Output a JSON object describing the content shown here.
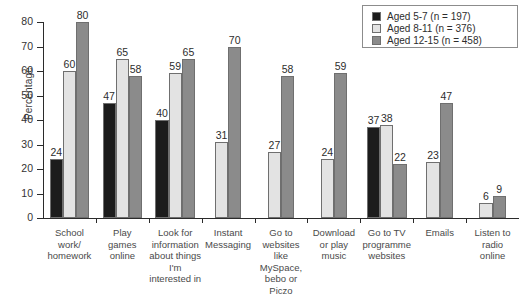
{
  "chart_data": {
    "type": "bar",
    "title": "",
    "xlabel": "",
    "ylabel": "Percentage",
    "ylim": [
      0,
      80
    ],
    "yticks": [
      0,
      10,
      20,
      30,
      40,
      50,
      60,
      70,
      80
    ],
    "grid": false,
    "legend_position": "top-right",
    "categories": [
      "School work/ homework",
      "Play games online",
      "Look for information about things I'm interested in",
      "Instant Messaging",
      "Go to websites like MySpace, bebo or Piczo",
      "Download or play music",
      "Go to TV programme websites",
      "Emails",
      "Listen to radio online"
    ],
    "category_lines": [
      [
        "School",
        "work/",
        "homework"
      ],
      [
        "Play",
        "games",
        "online"
      ],
      [
        "Look for",
        "information",
        "about things",
        "I'm",
        "interested in"
      ],
      [
        "Instant",
        "Messaging"
      ],
      [
        "Go to",
        "websites",
        "like",
        "MySpace,",
        "bebo or",
        "Piczo"
      ],
      [
        "Download",
        "or play",
        "music"
      ],
      [
        "Go to TV",
        "programme",
        "websites"
      ],
      [
        "Emails"
      ],
      [
        "Listen to",
        "radio",
        "online"
      ]
    ],
    "series": [
      {
        "name": "Aged 5-7 (n = 197)",
        "color": "#1c1c1c",
        "values": [
          24,
          47,
          40,
          null,
          null,
          null,
          37,
          null,
          null
        ]
      },
      {
        "name": "Aged 8-11 (n = 376)",
        "color": "#e3e3e3",
        "values": [
          60,
          65,
          59,
          31,
          27,
          24,
          38,
          23,
          6
        ]
      },
      {
        "name": "Aged 12-15 (n = 458)",
        "color": "#8b8b8b",
        "values": [
          80,
          58,
          65,
          70,
          58,
          59,
          22,
          47,
          9
        ]
      }
    ]
  },
  "legend": {
    "entries": [
      {
        "label": "Aged 5-7 (n = 197)",
        "color": "#1c1c1c"
      },
      {
        "label": "Aged 8-11 (n = 376)",
        "color": "#e3e3e3"
      },
      {
        "label": "Aged 12-15 (n = 458)",
        "color": "#8b8b8b"
      }
    ]
  },
  "axis": {
    "y_title": "Percentage",
    "y_tick_labels": [
      "0",
      "10",
      "20",
      "30",
      "40",
      "50",
      "60",
      "70",
      "80"
    ]
  }
}
